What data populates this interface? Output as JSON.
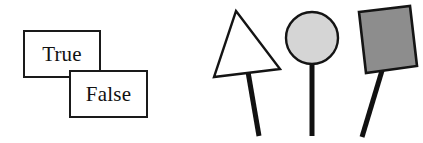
{
  "figure": {
    "background_color": "#ffffff",
    "outline_color": "#1a1a1a"
  },
  "label_boxes": {
    "true": {
      "text": "True",
      "fill": "#ffffff",
      "border": "#1a1a1a"
    },
    "false": {
      "text": "False",
      "fill": "#ffffff",
      "border": "#1a1a1a"
    }
  },
  "shapes": [
    {
      "name": "triangle-sign",
      "shape": "triangle",
      "fill": "#ffffff",
      "stroke": "#141414",
      "stick": "tilted-right"
    },
    {
      "name": "circle-sign",
      "shape": "circle",
      "fill": "#d5d5d5",
      "stroke": "#141414",
      "stick": "vertical"
    },
    {
      "name": "square-sign",
      "shape": "square",
      "fill": "#8d8d8d",
      "stroke": "#141414",
      "stick": "tilted-left"
    }
  ]
}
